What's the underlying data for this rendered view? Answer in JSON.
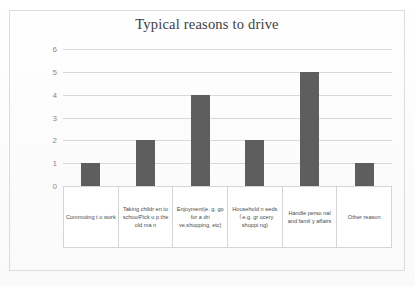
{
  "chart_data": {
    "type": "bar",
    "title": "Typical reasons to drive",
    "xlabel": "",
    "ylabel": "",
    "ylim": [
      0,
      6
    ],
    "yticks": [
      0,
      1,
      2,
      3,
      4,
      5,
      6
    ],
    "grid": true,
    "legend": false,
    "bar_color": "#5e5e5e",
    "gridline_color": "#d9d9d9",
    "categories": [
      "Commuting t o work",
      "Taking childr en to schoo/Pick u p the old ma n",
      "Enjoyment(e. g. go for a dri ve,shopping, etc)",
      "Household n eeds （e.g. gr ocery shoppi ng)",
      "Handle perso nal and famil y affairs",
      "Other reason"
    ],
    "values": [
      1,
      2,
      4,
      2,
      5,
      1
    ]
  },
  "frame": {
    "border_color": "#dcdcdc"
  }
}
